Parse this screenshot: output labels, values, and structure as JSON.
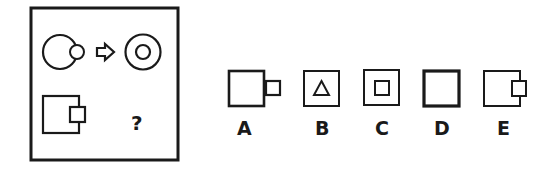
{
  "puzzle": {
    "question_mark": "?",
    "example_pair": {
      "source": "large-circle-with-small-circle-overlapping-right-edge",
      "arrow": "right-arrow",
      "result": "concentric-circles"
    },
    "prompt_shape": "large-square-with-small-square-overlapping-right-edge"
  },
  "options": [
    {
      "label": "A",
      "shape": "large-square-with-small-square-attached-outside-right"
    },
    {
      "label": "B",
      "shape": "square-with-triangle-inside"
    },
    {
      "label": "C",
      "shape": "concentric-squares"
    },
    {
      "label": "D",
      "shape": "thick-square"
    },
    {
      "label": "E",
      "shape": "square-with-small-square-overlapping-right-edge"
    }
  ],
  "colors": {
    "stroke": "#1a1a1a",
    "background": "#ffffff"
  }
}
